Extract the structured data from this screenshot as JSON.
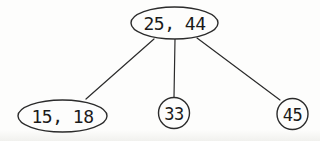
{
  "diagram": {
    "kind": "tree",
    "canvas": {
      "width": 319,
      "height": 141
    },
    "colors": {
      "background": "#fdfdfc",
      "stroke": "#2b2b2b",
      "text": "#1a1a1a",
      "node_fill": "#fdfdfc"
    },
    "nodes": [
      {
        "id": "root",
        "label": "25, 44",
        "shape": "ellipse",
        "cx": 174.5,
        "cy": 23,
        "rx": 43.5,
        "ry": 16,
        "label_size": 18
      },
      {
        "id": "child-left",
        "label": "15, 18",
        "shape": "ellipse",
        "cx": 62.5,
        "cy": 116,
        "rx": 44.5,
        "ry": 16,
        "label_size": 18
      },
      {
        "id": "child-middle",
        "label": "33",
        "shape": "circle",
        "cx": 174,
        "cy": 113,
        "rx": 15.5,
        "ry": 15.5,
        "label_size": 17
      },
      {
        "id": "child-right",
        "label": "45",
        "shape": "circle",
        "cx": 292.5,
        "cy": 114,
        "rx": 15.5,
        "ry": 15.5,
        "label_size": 17
      }
    ],
    "edges": [
      {
        "id": "edge-root-child-left",
        "from": "root",
        "to": "child-left",
        "x1": 154,
        "y1": 39,
        "x2": 86,
        "y2": 99
      },
      {
        "id": "edge-root-child-middle",
        "from": "root",
        "to": "child-middle",
        "x1": 175,
        "y1": 39,
        "x2": 174,
        "y2": 97
      },
      {
        "id": "edge-root-child-right",
        "from": "root",
        "to": "child-right",
        "x1": 197,
        "y1": 38,
        "x2": 280,
        "y2": 100
      }
    ]
  }
}
